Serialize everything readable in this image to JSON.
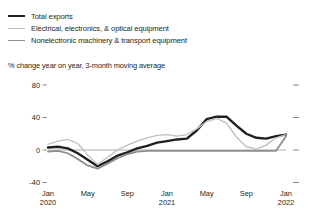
{
  "legend": {
    "items": [
      {
        "label": "Total exports",
        "key": "total_exports",
        "color": "#231f20",
        "width": 2.4
      },
      {
        "label": "Electrical, electronics, & optical equipment",
        "key": "electrical",
        "color": "#bfbfbf",
        "width": 1.3
      },
      {
        "label": "Nonelectronic machinery & transport equipment",
        "key": "nonelectronic",
        "color": "#8d8d8d",
        "width": 1.8
      }
    ]
  },
  "chart_data": {
    "type": "line",
    "title": "",
    "subtitle": "% change year on year, 3-month moving average",
    "xlabel": "",
    "ylabel": "",
    "ylim": [
      -40,
      80
    ],
    "yticks": [
      80,
      40,
      0,
      -40
    ],
    "ytick_labels": [
      "80",
      "40",
      "0",
      "-40"
    ],
    "grid": false,
    "zero_line": true,
    "legend_position": "top-left",
    "x_axis_ticks": [
      {
        "label": "Jan",
        "sublabel": "2020",
        "index": 0
      },
      {
        "label": "May",
        "sublabel": "",
        "index": 4
      },
      {
        "label": "Sep",
        "sublabel": "",
        "index": 8
      },
      {
        "label": "Jan",
        "sublabel": "2021",
        "index": 12
      },
      {
        "label": "May",
        "sublabel": "",
        "index": 16
      },
      {
        "label": "Sep",
        "sublabel": "",
        "index": 20
      },
      {
        "label": "Jan",
        "sublabel": "2022",
        "index": 24
      }
    ],
    "x": [
      "2020-01",
      "2020-02",
      "2020-03",
      "2020-04",
      "2020-05",
      "2020-06",
      "2020-07",
      "2020-08",
      "2020-09",
      "2020-10",
      "2020-11",
      "2020-12",
      "2021-01",
      "2021-02",
      "2021-03",
      "2021-04",
      "2021-05",
      "2021-06",
      "2021-07",
      "2021-08",
      "2021-09",
      "2021-10",
      "2021-11",
      "2021-12",
      "2022-01"
    ],
    "series": [
      {
        "name": "Total exports",
        "color": "#231f20",
        "width": 2.4,
        "values": [
          3,
          4,
          2,
          -4,
          -12,
          -20,
          -14,
          -7,
          -3,
          2,
          5,
          9,
          11,
          13,
          14,
          24,
          38,
          41,
          41,
          30,
          20,
          15,
          14,
          17,
          19
        ]
      },
      {
        "name": "Electrical, electronics, & optical equipment",
        "color": "#bfbfbf",
        "width": 1.3,
        "values": [
          7,
          11,
          13,
          8,
          -6,
          -18,
          -9,
          0,
          6,
          11,
          15,
          18,
          19,
          17,
          19,
          26,
          35,
          39,
          33,
          16,
          4,
          1,
          6,
          15,
          19
        ]
      },
      {
        "name": "Nonelectronic machinery & transport equipment",
        "color": "#8d8d8d",
        "width": 1.8,
        "values": [
          -2,
          -1,
          -4,
          -11,
          -19,
          -23,
          -17,
          -10,
          -5,
          -2,
          -1,
          -1,
          -1,
          -1,
          -1,
          -1,
          -1,
          -1,
          -1,
          -1,
          -1,
          -1,
          -1,
          -1,
          17
        ]
      }
    ]
  }
}
